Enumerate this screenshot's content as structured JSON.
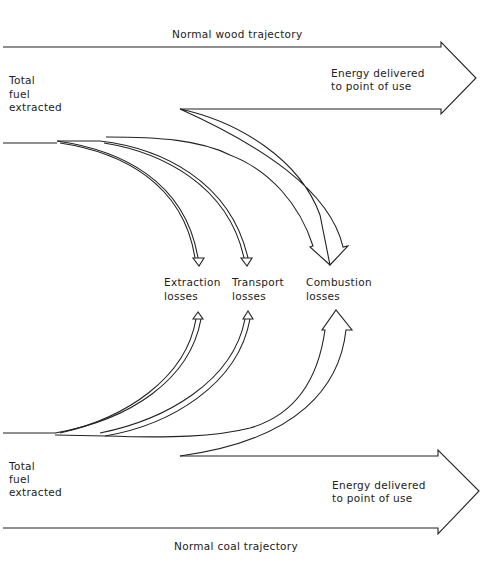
{
  "diagram": {
    "wood": {
      "trajectory_label": "Normal wood trajectory",
      "source_label": [
        "Total",
        "fuel",
        "extracted"
      ],
      "output_label": [
        "Energy delivered",
        "to point of use"
      ]
    },
    "losses": {
      "extraction": [
        "Extraction",
        "losses"
      ],
      "transport": [
        "Transport",
        "losses"
      ],
      "combustion": [
        "Combustion",
        "losses"
      ]
    },
    "coal": {
      "trajectory_label": "Normal coal trajectory",
      "source_label": [
        "Total",
        "fuel",
        "extracted"
      ],
      "output_label": [
        "Energy delivered",
        "to point of use"
      ]
    },
    "colors": {
      "line": "#222222",
      "background": "#ffffff"
    }
  }
}
